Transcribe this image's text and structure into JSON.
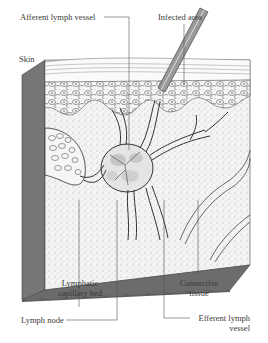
{
  "figure": {
    "labels": {
      "afferent_lymph_vessel": "Afferent lymph vessel",
      "infected_area": "Infected area",
      "skin": "Skin",
      "lymphatic_capillary_bed_line1": "Lymphatic",
      "lymphatic_capillary_bed_line2": "capillary bed",
      "connective_tissue_line1": "Connective",
      "connective_tissue_line2": "tissue",
      "lymph_node": "Lymph node",
      "efferent_lymph_vessel_line1": "Efferent lymph",
      "efferent_lymph_vessel_line2": "vessel"
    },
    "colors": {
      "background": "#ffffff",
      "box_side": "#707070",
      "box_bottom": "#6a6a6a",
      "tissue_fill": "#f1f1f1",
      "line": "#444444",
      "text": "#3a3a3a"
    }
  }
}
